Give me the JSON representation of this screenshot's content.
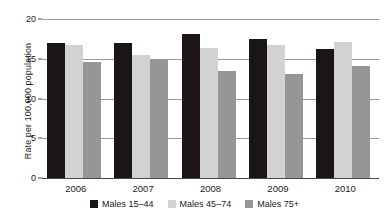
{
  "chart_data": {
    "type": "bar",
    "title": "",
    "subtitle": "",
    "xlabel": "",
    "ylabel": "Rate per 100,000 population",
    "categories": [
      "2006",
      "2007",
      "2008",
      "2009",
      "2010"
    ],
    "series": [
      {
        "name": "Males 15–44",
        "color": "#1c1517",
        "values": [
          17.0,
          17.0,
          18.1,
          17.5,
          16.2
        ]
      },
      {
        "name": "Males 45–74",
        "color": "#d2d2d2",
        "values": [
          16.7,
          15.5,
          16.4,
          16.7,
          17.1
        ]
      },
      {
        "name": "Males 75+",
        "color": "#969696",
        "values": [
          14.6,
          14.8,
          13.4,
          13.1,
          14.1
        ]
      }
    ],
    "ylim": [
      0,
      20
    ],
    "yticks": [
      0,
      5,
      10,
      15,
      20
    ],
    "ytick_labels": [
      "0",
      "5",
      "10",
      "15",
      "20"
    ],
    "grid": true,
    "grid_axis": "y",
    "legend_position": "bottom",
    "legend_entries": [
      "Males 15–44",
      "Males 45–74",
      "Males 75+"
    ]
  },
  "axis": {
    "y_title": "Rate per 100,000 population"
  }
}
